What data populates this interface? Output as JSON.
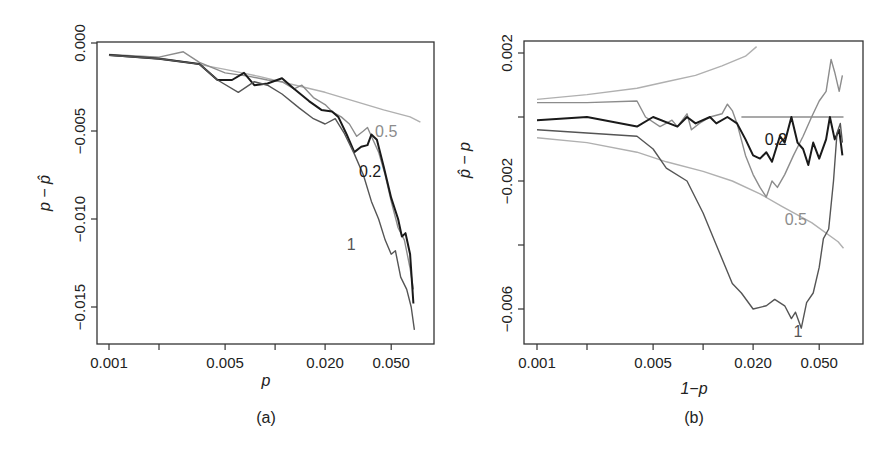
{
  "figure": {
    "panels": [
      {
        "id": "a",
        "caption": "(a)",
        "xlabel": "p",
        "ylabel": "p − p̂"
      },
      {
        "id": "b",
        "caption": "(b)",
        "xlabel": "1−p",
        "ylabel": "p̂ − p"
      }
    ]
  },
  "colors": {
    "series_1": "#555555",
    "series_0.2": "#1a1a1a",
    "series_0.5": "#8c8c8c",
    "reference": "#b0b0b0",
    "axis": "#333333"
  },
  "chart_data": [
    {
      "type": "line",
      "title": "(a)",
      "xlabel": "p",
      "ylabel": "p − p̂",
      "xscale": "log",
      "xlim": [
        0.00093,
        0.075
      ],
      "ylim": [
        -0.01725,
        0.0003
      ],
      "xticks": [
        0.001,
        0.002,
        0.005,
        0.01,
        0.02,
        0.05
      ],
      "xtick_labels": [
        "0.001",
        "",
        "0.005",
        "",
        "0.020",
        "0.050"
      ],
      "yticks": [
        0.0,
        -0.005,
        -0.01,
        -0.015
      ],
      "ytick_labels": [
        "0.000",
        "−0.005",
        "−0.010",
        "−0.015"
      ],
      "grid": false,
      "series": [
        {
          "name": "reference",
          "label": "",
          "color": "#b0b0b0",
          "points": [
            [
              0.001,
              -0.00068
            ],
            [
              0.002,
              -0.00085
            ],
            [
              0.003,
              -0.0011
            ],
            [
              0.005,
              -0.0015
            ],
            [
              0.008,
              -0.0019
            ],
            [
              0.012,
              -0.0023
            ],
            [
              0.02,
              -0.0028
            ],
            [
              0.03,
              -0.0033
            ],
            [
              0.045,
              -0.0038
            ],
            [
              0.065,
              -0.0042
            ],
            [
              0.075,
              -0.0045
            ]
          ]
        },
        {
          "name": "0.5",
          "label": "0.5",
          "color": "#8c8c8c",
          "points": [
            [
              0.001,
              -0.00065
            ],
            [
              0.002,
              -0.0008
            ],
            [
              0.0028,
              -0.0005
            ],
            [
              0.0035,
              -0.0011
            ],
            [
              0.005,
              -0.0017
            ],
            [
              0.007,
              -0.0019
            ],
            [
              0.009,
              -0.0021
            ],
            [
              0.011,
              -0.0022
            ],
            [
              0.013,
              -0.0026
            ],
            [
              0.0145,
              -0.0024
            ],
            [
              0.017,
              -0.0031
            ],
            [
              0.02,
              -0.0035
            ],
            [
              0.022,
              -0.0039
            ],
            [
              0.025,
              -0.0042
            ],
            [
              0.028,
              -0.0046
            ],
            [
              0.031,
              -0.0053
            ],
            [
              0.034,
              -0.005
            ],
            [
              0.036,
              -0.0048
            ],
            [
              0.038,
              -0.0053
            ],
            [
              0.042,
              -0.0062
            ],
            [
              0.046,
              -0.0075
            ],
            [
              0.05,
              -0.009
            ],
            [
              0.055,
              -0.0105
            ],
            [
              0.06,
              -0.0112
            ],
            [
              0.065,
              -0.0128
            ],
            [
              0.068,
              -0.014
            ]
          ]
        },
        {
          "name": "0.2",
          "label": "0.2",
          "color": "#1a1a1a",
          "points": [
            [
              0.001,
              -0.00068
            ],
            [
              0.002,
              -0.0009
            ],
            [
              0.0035,
              -0.0012
            ],
            [
              0.0045,
              -0.0021
            ],
            [
              0.0055,
              -0.0021
            ],
            [
              0.0065,
              -0.0017
            ],
            [
              0.0075,
              -0.0024
            ],
            [
              0.009,
              -0.0023
            ],
            [
              0.011,
              -0.002
            ],
            [
              0.013,
              -0.0026
            ],
            [
              0.016,
              -0.0033
            ],
            [
              0.019,
              -0.0038
            ],
            [
              0.022,
              -0.0039
            ],
            [
              0.024,
              -0.0042
            ],
            [
              0.027,
              -0.0052
            ],
            [
              0.03,
              -0.0062
            ],
            [
              0.033,
              -0.0059
            ],
            [
              0.036,
              -0.0058
            ],
            [
              0.038,
              -0.0052
            ],
            [
              0.041,
              -0.0055
            ],
            [
              0.045,
              -0.007
            ],
            [
              0.05,
              -0.0088
            ],
            [
              0.055,
              -0.01
            ],
            [
              0.058,
              -0.011
            ],
            [
              0.061,
              -0.0108
            ],
            [
              0.065,
              -0.012
            ],
            [
              0.068,
              -0.0148
            ]
          ]
        },
        {
          "name": "1",
          "label": "1",
          "color": "#555555",
          "points": [
            [
              0.001,
              -0.0007
            ],
            [
              0.002,
              -0.0009
            ],
            [
              0.0035,
              -0.0012
            ],
            [
              0.0045,
              -0.0021
            ],
            [
              0.006,
              -0.0028
            ],
            [
              0.0075,
              -0.0022
            ],
            [
              0.009,
              -0.0024
            ],
            [
              0.011,
              -0.0029
            ],
            [
              0.014,
              -0.0037
            ],
            [
              0.017,
              -0.0043
            ],
            [
              0.02,
              -0.0046
            ],
            [
              0.023,
              -0.0043
            ],
            [
              0.026,
              -0.0051
            ],
            [
              0.03,
              -0.0063
            ],
            [
              0.034,
              -0.0075
            ],
            [
              0.038,
              -0.009
            ],
            [
              0.042,
              -0.01
            ],
            [
              0.046,
              -0.0112
            ],
            [
              0.05,
              -0.012
            ],
            [
              0.053,
              -0.0118
            ],
            [
              0.057,
              -0.0133
            ],
            [
              0.062,
              -0.014
            ],
            [
              0.066,
              -0.015
            ],
            [
              0.069,
              -0.0163
            ]
          ]
        }
      ],
      "annotations": [
        {
          "text": "0.5",
          "x": 0.04,
          "y": -0.005
        },
        {
          "text": "0.2",
          "x": 0.032,
          "y": -0.0073
        },
        {
          "text": "1",
          "x": 0.027,
          "y": -0.0114
        }
      ]
    },
    {
      "type": "line",
      "title": "(b)",
      "xlabel": "1−p",
      "ylabel": "p̂ − p",
      "xscale": "log",
      "xlim": [
        0.00093,
        0.075
      ],
      "ylim": [
        -0.0071,
        0.0024
      ],
      "xticks": [
        0.001,
        0.002,
        0.005,
        0.01,
        0.02,
        0.05
      ],
      "xtick_labels": [
        "0.001",
        "",
        "0.005",
        "",
        "0.020",
        "0.050"
      ],
      "yticks": [
        0.002,
        0.0,
        -0.002,
        -0.004,
        -0.006
      ],
      "ytick_labels": [
        "0.002",
        "",
        "−0.002",
        "",
        "−0.006"
      ],
      "grid": false,
      "series": [
        {
          "name": "zero-line",
          "label": "",
          "color": "#8c8c8c",
          "points": [
            [
              0.017,
              0.0
            ],
            [
              0.07,
              0.0
            ]
          ]
        },
        {
          "name": "reference-upper",
          "label": "",
          "color": "#b0b0b0",
          "points": [
            [
              0.001,
              0.00055
            ],
            [
              0.002,
              0.0007
            ],
            [
              0.004,
              0.0009
            ],
            [
              0.006,
              0.0011
            ],
            [
              0.009,
              0.0013
            ],
            [
              0.013,
              0.0016
            ],
            [
              0.018,
              0.0019
            ],
            [
              0.021,
              0.0022
            ]
          ]
        },
        {
          "name": "reference-lower",
          "label": "",
          "color": "#b0b0b0",
          "points": [
            [
              0.001,
              -0.00065
            ],
            [
              0.002,
              -0.0008
            ],
            [
              0.004,
              -0.0011
            ],
            [
              0.006,
              -0.0014
            ],
            [
              0.01,
              -0.0017
            ],
            [
              0.015,
              -0.002
            ],
            [
              0.022,
              -0.0024
            ],
            [
              0.03,
              -0.0028
            ],
            [
              0.045,
              -0.0033
            ],
            [
              0.065,
              -0.0039
            ],
            [
              0.07,
              -0.0041
            ]
          ]
        },
        {
          "name": "0.5",
          "label": "0.5",
          "color": "#8c8c8c",
          "points": [
            [
              0.001,
              0.00045
            ],
            [
              0.002,
              0.00045
            ],
            [
              0.004,
              0.0005
            ],
            [
              0.0045,
              0.0
            ],
            [
              0.0055,
              -0.0003
            ],
            [
              0.0065,
              -0.0001
            ],
            [
              0.007,
              -0.0003
            ],
            [
              0.008,
              0.0001
            ],
            [
              0.0085,
              -0.0004
            ],
            [
              0.0095,
              -0.0002
            ],
            [
              0.011,
              0.0
            ],
            [
              0.013,
              0.0001
            ],
            [
              0.014,
              0.0004
            ],
            [
              0.015,
              0.0002
            ],
            [
              0.016,
              -0.0002
            ],
            [
              0.018,
              -0.0012
            ],
            [
              0.02,
              -0.0018
            ],
            [
              0.022,
              -0.0022
            ],
            [
              0.024,
              -0.0025
            ],
            [
              0.026,
              -0.002
            ],
            [
              0.028,
              -0.0022
            ],
            [
              0.031,
              -0.0018
            ],
            [
              0.035,
              -0.0012
            ],
            [
              0.04,
              -0.0006
            ],
            [
              0.045,
              0.0
            ],
            [
              0.05,
              0.0005
            ],
            [
              0.055,
              0.0008
            ],
            [
              0.059,
              0.0018
            ],
            [
              0.062,
              0.0014
            ],
            [
              0.066,
              0.0008
            ],
            [
              0.069,
              0.0013
            ]
          ]
        },
        {
          "name": "0.2",
          "label": "0.2",
          "color": "#1a1a1a",
          "points": [
            [
              0.001,
              -0.0001
            ],
            [
              0.002,
              0.0
            ],
            [
              0.004,
              -0.0003
            ],
            [
              0.005,
              0.0
            ],
            [
              0.007,
              -0.0003
            ],
            [
              0.008,
              0.0
            ],
            [
              0.009,
              -0.0002
            ],
            [
              0.011,
              0.0
            ],
            [
              0.012,
              -0.0002
            ],
            [
              0.014,
              0.0
            ],
            [
              0.016,
              -0.0002
            ],
            [
              0.018,
              -0.0007
            ],
            [
              0.02,
              -0.0012
            ],
            [
              0.022,
              -0.0013
            ],
            [
              0.024,
              -0.0011
            ],
            [
              0.026,
              -0.0014
            ],
            [
              0.029,
              -0.0006
            ],
            [
              0.031,
              -0.0008
            ],
            [
              0.034,
              0.0
            ],
            [
              0.037,
              -0.0008
            ],
            [
              0.04,
              -0.001
            ],
            [
              0.043,
              -0.0015
            ],
            [
              0.046,
              -0.0008
            ],
            [
              0.05,
              -0.0013
            ],
            [
              0.055,
              -0.0007
            ],
            [
              0.058,
              0.0
            ],
            [
              0.062,
              -0.0007
            ],
            [
              0.066,
              -0.0004
            ],
            [
              0.069,
              -0.0012
            ]
          ]
        },
        {
          "name": "1",
          "label": "1",
          "color": "#555555",
          "points": [
            [
              0.001,
              -0.0004
            ],
            [
              0.002,
              -0.0005
            ],
            [
              0.004,
              -0.0006
            ],
            [
              0.005,
              -0.001
            ],
            [
              0.006,
              -0.0016
            ],
            [
              0.008,
              -0.002
            ],
            [
              0.01,
              -0.003
            ],
            [
              0.012,
              -0.004
            ],
            [
              0.015,
              -0.0052
            ],
            [
              0.017,
              -0.0055
            ],
            [
              0.02,
              -0.006
            ],
            [
              0.024,
              -0.0059
            ],
            [
              0.027,
              -0.0057
            ],
            [
              0.031,
              -0.0059
            ],
            [
              0.034,
              -0.0063
            ],
            [
              0.036,
              -0.0061
            ],
            [
              0.039,
              -0.0066
            ],
            [
              0.042,
              -0.0058
            ],
            [
              0.046,
              -0.0055
            ],
            [
              0.05,
              -0.0047
            ],
            [
              0.053,
              -0.0038
            ],
            [
              0.057,
              -0.0035
            ],
            [
              0.061,
              -0.002
            ],
            [
              0.064,
              -0.0005
            ],
            [
              0.067,
              -0.0002
            ],
            [
              0.069,
              -0.0008
            ]
          ]
        }
      ],
      "annotations": [
        {
          "text": "0.2",
          "x": 0.0235,
          "y": -0.0007
        },
        {
          "text": "0.5",
          "x": 0.031,
          "y": -0.0032
        },
        {
          "text": "1",
          "x": 0.035,
          "y": -0.0067
        }
      ]
    }
  ]
}
